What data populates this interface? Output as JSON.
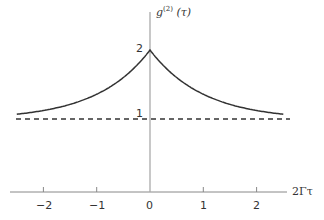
{
  "chart_data": {
    "type": "line",
    "title": "",
    "xlabel": "2Γτ",
    "ylabel": "g(2) (τ)",
    "ylabel_base": "g",
    "ylabel_sup": "(2)",
    "ylabel_arg": " (τ)",
    "xlim": [
      -2.5,
      2.5
    ],
    "ylim": [
      0,
      2
    ],
    "x_ticks": [
      "−2",
      "−1",
      "0",
      "1",
      "2"
    ],
    "y_ticks": [
      "1",
      "2"
    ],
    "grid": false,
    "series": [
      {
        "name": "g2 (thermal light)",
        "style": "solid",
        "function": "1+exp(-|x|)",
        "x": [
          -2.5,
          -2,
          -1.5,
          -1,
          -0.5,
          0,
          0.5,
          1,
          1.5,
          2,
          2.5
        ],
        "y": [
          1.08,
          1.14,
          1.22,
          1.37,
          1.61,
          2.0,
          1.61,
          1.37,
          1.22,
          1.14,
          1.08
        ]
      },
      {
        "name": "coherent level",
        "style": "dashed",
        "x": [
          -2.5,
          2.5
        ],
        "y": [
          1,
          1
        ]
      }
    ]
  }
}
